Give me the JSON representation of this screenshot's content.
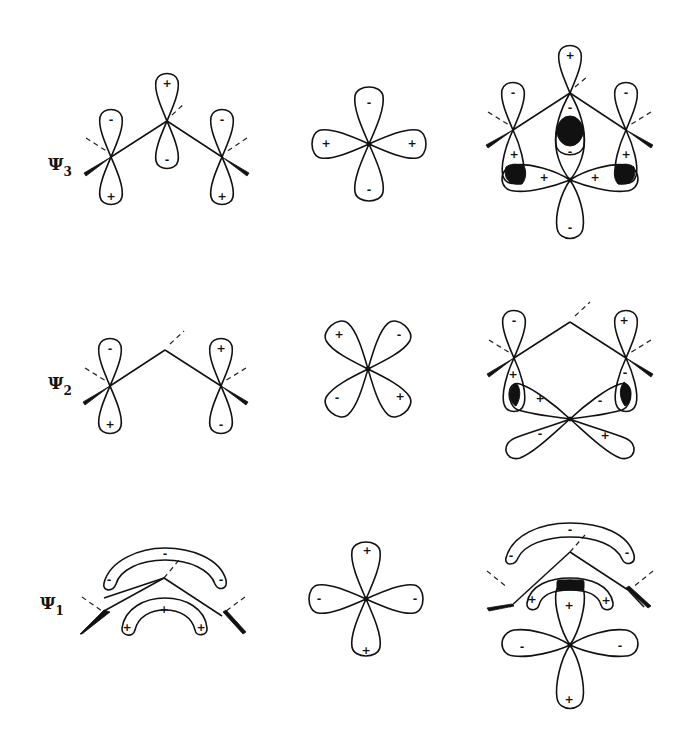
{
  "diagram": {
    "type": "molecular-orbital-interaction",
    "columns": [
      "allyl pi orbital",
      "metal d orbital",
      "combined orbital"
    ],
    "rows": [
      {
        "label": "Ψ",
        "subscript": "3",
        "allyl_signs": {
          "left_top": "-",
          "left_bottom": "+",
          "center_top": "+",
          "center_bottom": "-",
          "right_top": "-",
          "right_bottom": "+"
        },
        "d_orbital": {
          "shape": "plus",
          "top": "-",
          "bottom": "-",
          "left": "+",
          "right": "+"
        },
        "combined_signs": {
          "top": "+",
          "left_top": "-",
          "right_top": "-",
          "center_upper": "-",
          "center_lower": "-",
          "left_lower": "+",
          "right_lower": "+",
          "left_lobe": "+",
          "right_lobe": "+",
          "bottom": "-"
        }
      },
      {
        "label": "Ψ",
        "subscript": "2",
        "allyl_signs": {
          "left_top": "-",
          "left_bottom": "+",
          "right_top": "+",
          "right_bottom": "-"
        },
        "d_orbital": {
          "shape": "x",
          "upper_left": "+",
          "upper_right": "-",
          "lower_left": "-",
          "lower_right": "+"
        },
        "combined_signs": {
          "left_top": "-",
          "left_bottom": "+",
          "right_top": "+",
          "right_bottom": "-",
          "d_upper_left": "+",
          "d_upper_right": "-",
          "d_lower_left": "-",
          "d_lower_right": "+"
        }
      },
      {
        "label": "Ψ",
        "subscript": "1",
        "allyl_signs": {
          "upper_band_center": "-",
          "upper_band_left": "-",
          "upper_band_right": "-",
          "lower_band_center": "+",
          "lower_band_left": "+",
          "lower_band_right": "+"
        },
        "d_orbital": {
          "shape": "plus",
          "top": "+",
          "bottom": "+",
          "left": "-",
          "right": "-"
        },
        "combined_signs": {
          "upper_band_center": "-",
          "upper_band_left": "-",
          "upper_band_right": "-",
          "lower_band_left": "+",
          "lower_band_right": "+",
          "top": "+",
          "left": "-",
          "right": "-",
          "bottom": "+"
        }
      }
    ]
  }
}
